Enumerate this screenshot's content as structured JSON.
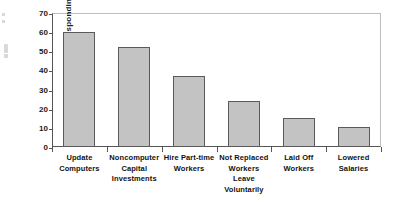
{
  "chart_data": {
    "type": "bar",
    "title": "",
    "subtitle": "",
    "xlabel": "",
    "ylabel": "Percent Responding",
    "ylim": [
      0,
      70
    ],
    "yticks": [
      0,
      10,
      20,
      30,
      40,
      50,
      60,
      70
    ],
    "ytick_labels": [
      "0",
      "10",
      "20",
      "30",
      "40",
      "50",
      "60",
      "70"
    ],
    "grid": false,
    "legend": null,
    "orientation": "vertical",
    "categories": [
      "Update Computers",
      "Noncomputer Capital Investments",
      "Hire Part-time Workers",
      "Not Replaced Workers Leave Voluntarily",
      "Laid Off Workers",
      "Lowered Salaries"
    ],
    "category_lines": [
      [
        "Update",
        "Computers"
      ],
      [
        "Noncomputer",
        "Capital",
        "Investments"
      ],
      [
        "Hire Part-time",
        "Workers"
      ],
      [
        "Not Replaced",
        "Workers",
        "Leave",
        "Voluntarily"
      ],
      [
        "Laid Off",
        "Workers"
      ],
      [
        "Lowered",
        "Salaries"
      ]
    ],
    "values": [
      60,
      52,
      37,
      24,
      15,
      10.5
    ],
    "bar_color": "#c3c3c3",
    "bar_edge_color": "#5a5a5a",
    "axis_color": "#555555",
    "frame_color": "#bdbdbd",
    "text_color": "#111111",
    "background": "#ffffff"
  }
}
